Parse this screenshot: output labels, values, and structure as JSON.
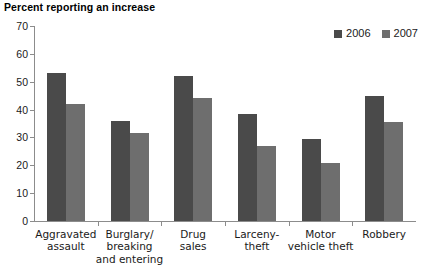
{
  "title": "Percent reporting an increase",
  "legend": {
    "position": "top-right",
    "entries": [
      {
        "label": "2006",
        "color": "#4a4a4a",
        "swatch_icon": "square-swatch-icon"
      },
      {
        "label": "2007",
        "color": "#6e6e6e",
        "swatch_icon": "square-swatch-icon"
      }
    ]
  },
  "chart_data": {
    "type": "bar",
    "title": "Percent reporting an increase",
    "xlabel": "",
    "ylabel": "",
    "ylim": [
      0,
      70
    ],
    "yticks": [
      0,
      10,
      20,
      30,
      40,
      50,
      60,
      70
    ],
    "grid": false,
    "legend_position": "top-right",
    "categories": [
      "Aggravated assault",
      "Burglary/ breaking and entering",
      "Drug sales",
      "Larceny-theft",
      "Motor vehicle theft",
      "Robbery"
    ],
    "category_lines": [
      [
        "Aggravated",
        "assault"
      ],
      [
        "Burglary/",
        "breaking",
        "and entering"
      ],
      [
        "Drug",
        "sales"
      ],
      [
        "Larceny-",
        "theft"
      ],
      [
        "Motor",
        "vehicle theft"
      ],
      [
        "Robbery"
      ]
    ],
    "series": [
      {
        "name": "2006",
        "color": "#4a4a4a",
        "values": [
          53,
          36,
          52,
          38.5,
          29.5,
          45
        ]
      },
      {
        "name": "2007",
        "color": "#6e6e6e",
        "values": [
          42,
          31.5,
          44,
          27,
          21,
          35.5
        ]
      }
    ]
  }
}
